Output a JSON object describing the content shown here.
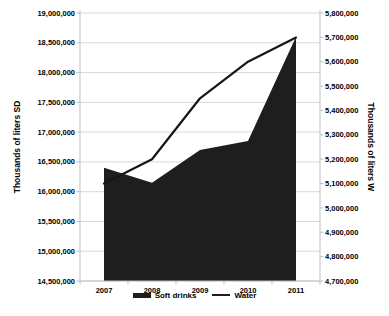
{
  "chart_data": {
    "type": "area+line combo",
    "categories": [
      "2007",
      "2008",
      "2009",
      "2010",
      "2011"
    ],
    "series": [
      {
        "name": "Soft drinks",
        "type": "area",
        "axis": "left",
        "color": "#1e1e1e",
        "values": [
          16400000,
          16150000,
          16700000,
          16850000,
          18600000
        ]
      },
      {
        "name": "Water",
        "type": "line",
        "axis": "right",
        "color": "#161616",
        "values": [
          5100000,
          5200000,
          5450000,
          5600000,
          5700000
        ]
      }
    ],
    "left_axis": {
      "title": "Thousands of liters SD",
      "min": 14500000,
      "max": 19000000,
      "step": 500000
    },
    "right_axis": {
      "title": "Thousands of liters W",
      "min": 4700000,
      "max": 5800000,
      "step": 100000
    },
    "xlabel": "",
    "title": "",
    "grid": true,
    "legend_position": "bottom",
    "colors": {
      "grid": "#d9d9d9",
      "axis": "#bfbfbf",
      "tick": "#bfbfbf",
      "text": "#000000",
      "background": "#ffffff"
    }
  }
}
